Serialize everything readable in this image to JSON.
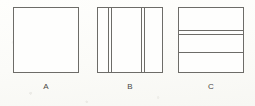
{
  "figure": {
    "background_color": "#fcfcfa",
    "line_color": "#6d6c68",
    "fill_color": "#fefefd",
    "caption_color": "#4a4945",
    "squares": [
      {
        "id": "a",
        "label": "A",
        "pattern": "blank",
        "description": "Plain empty square with no internal lines",
        "vertical_lines": [],
        "horizontal_lines": []
      },
      {
        "id": "b",
        "label": "B",
        "pattern": "vertical-lines",
        "description": "Square crossed by two pairs of closely spaced vertical lines",
        "vertical_lines": [
          10,
          13,
          43,
          46
        ],
        "horizontal_lines": []
      },
      {
        "id": "c",
        "label": "C",
        "pattern": "horizontal-lines",
        "description": "Square crossed by a close pair of horizontal lines and a third line below",
        "vertical_lines": [],
        "horizontal_lines": [
          22,
          26,
          44
        ]
      }
    ]
  }
}
